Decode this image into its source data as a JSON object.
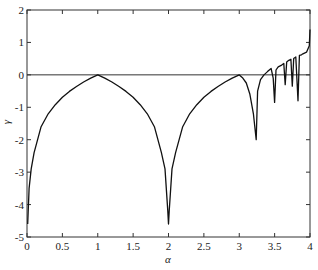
{
  "chart_data": {
    "type": "line",
    "title": "",
    "xlabel": "α",
    "ylabel": "γ",
    "xlim": [
      0,
      4
    ],
    "ylim": [
      -5,
      2
    ],
    "xticks": [
      0,
      0.5,
      1,
      1.5,
      2,
      2.5,
      3,
      3.5,
      4
    ],
    "xtick_labels": [
      "0",
      "0.5",
      "1",
      "1.5",
      "2",
      "2.5",
      "3",
      "3.5",
      "4"
    ],
    "yticks": [
      -5,
      -4,
      -3,
      -2,
      -1,
      0,
      1,
      2
    ],
    "ytick_labels": [
      "-5",
      "-4",
      "-3",
      "-2",
      "-1",
      "0",
      "1",
      "2"
    ],
    "grid": false,
    "reference_line": {
      "y": 0
    },
    "series": [
      {
        "name": "γ(α)",
        "x": [
          0.01,
          0.03,
          0.06,
          0.1,
          0.2,
          0.3,
          0.4,
          0.5,
          0.6,
          0.7,
          0.8,
          0.9,
          1.0,
          1.1,
          1.2,
          1.3,
          1.4,
          1.5,
          1.6,
          1.7,
          1.8,
          1.9,
          1.95,
          1.99,
          2.0,
          2.01,
          2.05,
          2.1,
          2.2,
          2.3,
          2.4,
          2.5,
          2.6,
          2.7,
          2.8,
          2.9,
          3.0,
          3.05,
          3.1,
          3.15,
          3.2,
          3.24,
          3.26,
          3.3,
          3.35,
          3.4,
          3.45,
          3.48,
          3.5,
          3.52,
          3.55,
          3.6,
          3.63,
          3.65,
          3.67,
          3.7,
          3.73,
          3.75,
          3.77,
          3.8,
          3.83,
          3.85,
          3.88,
          3.9,
          3.93,
          3.95,
          3.97,
          3.99,
          4.0
        ],
        "y": [
          -4.6,
          -3.5,
          -2.9,
          -2.4,
          -1.6,
          -1.2,
          -0.92,
          -0.69,
          -0.51,
          -0.36,
          -0.22,
          -0.1,
          0.0,
          -0.1,
          -0.22,
          -0.36,
          -0.51,
          -0.69,
          -0.92,
          -1.2,
          -1.6,
          -2.4,
          -2.9,
          -4.2,
          -4.6,
          -4.2,
          -2.9,
          -2.4,
          -1.6,
          -1.2,
          -0.92,
          -0.69,
          -0.51,
          -0.36,
          -0.22,
          -0.1,
          0.0,
          -0.1,
          -0.25,
          -0.6,
          -1.2,
          -2.0,
          -0.5,
          -0.15,
          0.0,
          0.1,
          0.2,
          -0.1,
          -0.85,
          0.15,
          0.25,
          0.3,
          0.35,
          -0.3,
          0.4,
          0.45,
          0.48,
          -0.35,
          0.5,
          0.55,
          -0.8,
          0.6,
          0.62,
          0.65,
          0.68,
          0.7,
          0.8,
          0.9,
          1.4
        ]
      }
    ]
  },
  "colors": {
    "line": "#111111",
    "axis": "#333333",
    "background": "#ffffff"
  }
}
